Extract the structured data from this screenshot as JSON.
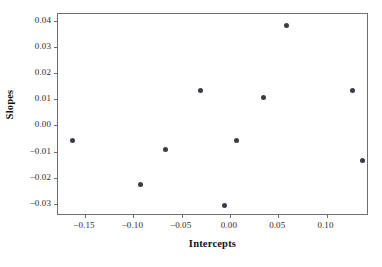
{
  "chart_data": {
    "type": "scatter",
    "title": "",
    "xlabel": "Intercepts",
    "ylabel": "Slopes",
    "xlim": [
      -0.178,
      0.144
    ],
    "ylim": [
      -0.0345,
      0.0425
    ],
    "grid": false,
    "legend": null,
    "xticks": [
      -0.15,
      -0.1,
      -0.05,
      0.0,
      0.05,
      0.1
    ],
    "xticklabels": [
      "−0.15",
      "−0.10",
      "−0.05",
      "0.00",
      "0.05",
      "0.10"
    ],
    "yticks": [
      0.04,
      0.03,
      0.02,
      0.01,
      0.0,
      -0.01,
      -0.02,
      -0.03
    ],
    "yticklabels": [
      "0.04",
      "0.03",
      "0.02",
      "0.01",
      "0.00",
      "−0.01",
      "−0.02",
      "−0.03"
    ],
    "marker": "filled-circle",
    "marker_color": "#3b3b43",
    "marker_size": 5,
    "n_points": 10,
    "x": [
      -0.163,
      -0.0925,
      -0.0665,
      -0.0305,
      -0.006,
      0.0065,
      0.035,
      0.059,
      0.1265,
      0.1375
    ],
    "y": [
      -0.0057,
      -0.0226,
      -0.0093,
      0.0133,
      -0.0304,
      -0.0057,
      0.0105,
      0.0383,
      0.0133,
      -0.0135
    ],
    "points": [
      {
        "x": -0.163,
        "y": -0.0057
      },
      {
        "x": -0.0925,
        "y": -0.0226
      },
      {
        "x": -0.0665,
        "y": -0.0093
      },
      {
        "x": -0.0305,
        "y": 0.0133
      },
      {
        "x": -0.006,
        "y": -0.0304
      },
      {
        "x": 0.0065,
        "y": -0.0057
      },
      {
        "x": 0.035,
        "y": 0.0105
      },
      {
        "x": 0.059,
        "y": 0.0383
      },
      {
        "x": 0.1265,
        "y": 0.0133
      },
      {
        "x": 0.1375,
        "y": -0.0135
      }
    ]
  },
  "axes": {
    "x_title": "Intercepts",
    "y_title": "Slopes",
    "frame_color": "#6e6e73"
  }
}
